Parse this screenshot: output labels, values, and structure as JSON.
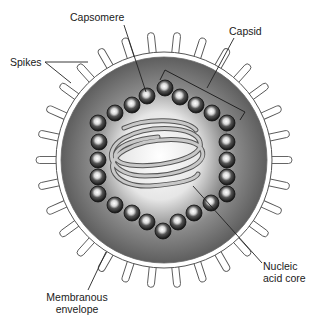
{
  "diagram": {
    "labels": {
      "capsomere": "Capsomere",
      "capsid": "Capsid",
      "spikes": "Spikes",
      "nucleic_line1": "Nucleic",
      "nucleic_line2": "acid core",
      "membranous_line1": "Membranous",
      "membranous_line2": "envelope"
    },
    "geometry": {
      "center": [
        164,
        160
      ],
      "membrane_radius": 108,
      "spike_length": 20,
      "spike_count": 30
    },
    "colors": {
      "background": "#ffffff",
      "membrane": "#ffffff",
      "membrane_outline": "#555555",
      "interior_dark": "#5a5a5a",
      "interior_mid": "#9a9a9a",
      "core_light": "#f4f4f4",
      "capsomere_dark": "#1e1e1e",
      "capsomere_highlight": "#f0f0f0",
      "helix": "#9c9c9c",
      "leader_line": "#222222"
    }
  }
}
